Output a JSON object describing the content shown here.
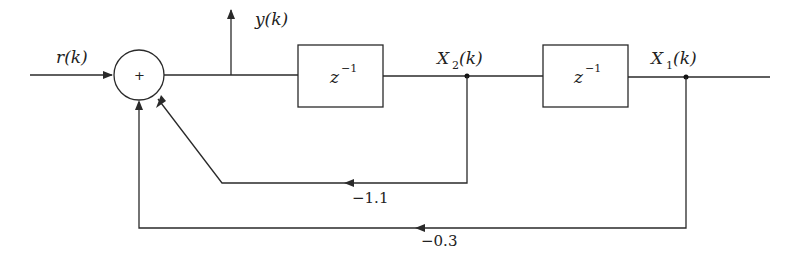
{
  "diagram": {
    "type": "discrete-time block diagram",
    "input": {
      "label": "r(k)"
    },
    "summing_junction": {
      "sign": "+"
    },
    "output": {
      "label": "y(k)"
    },
    "blocks": [
      {
        "id": "delay1",
        "base": "z",
        "exponent": "−1"
      },
      {
        "id": "delay2",
        "base": "z",
        "exponent": "−1"
      }
    ],
    "states": [
      {
        "id": "x2",
        "base": "X",
        "sub": "2",
        "arg": "(k)"
      },
      {
        "id": "x1",
        "base": "X",
        "sub": "1",
        "arg": "(k)"
      }
    ],
    "feedback": [
      {
        "from": "X2(k)",
        "gain": "−1.1"
      },
      {
        "from": "X1(k)",
        "gain": "−0.3"
      }
    ]
  }
}
